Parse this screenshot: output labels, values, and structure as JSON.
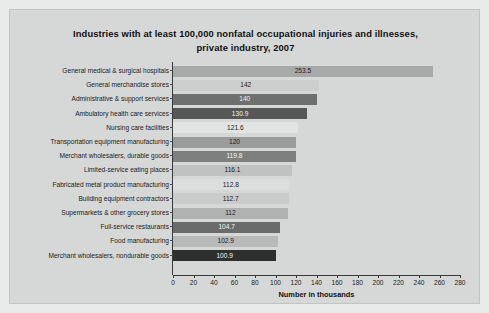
{
  "chart_data": {
    "type": "bar",
    "orientation": "horizontal",
    "title": "Industries with at least 100,000 nonfatal occupational injuries and illnesses, private industry, 2007",
    "title_line1": "Industries with at least 100,000 nonfatal occupational injuries and illnesses,",
    "title_line2": "private industry, 2007",
    "xlabel": "Number in thousands",
    "ylabel": "",
    "xlim": [
      0,
      280
    ],
    "xticks": [
      0,
      20,
      40,
      60,
      80,
      100,
      120,
      140,
      160,
      180,
      200,
      220,
      240,
      260,
      280
    ],
    "grid": false,
    "legend": "none",
    "categories": [
      "General medical & surgical hospitals",
      "General merchandise stores",
      "Administrative & support services",
      "Ambulatory health care services",
      "Nursing care facilities",
      "Transportation equipment manufacturing",
      "Merchant wholesalers, durable goods",
      "Limited-service eating places",
      "Fabricated metal product manufacturing",
      "Building equipment contractors",
      "Supermarkets & other grocery stores",
      "Full-service restaurants",
      "Food manufacturing",
      "Merchant wholesalers, nondurable goods"
    ],
    "values": [
      253.5,
      142,
      140,
      130.9,
      121.6,
      120,
      119.8,
      116.1,
      112.8,
      112.7,
      112,
      104.7,
      102.9,
      100.9
    ],
    "value_labels": [
      "253.5",
      "142",
      "140",
      "130.9",
      "121.6",
      "120",
      "119.8",
      "116.1",
      "112.8",
      "112.7",
      "112",
      "104.7",
      "102.9",
      "100.9"
    ],
    "bar_colors": [
      "#a8aaaa",
      "#cdcfcf",
      "#6e7070",
      "#565858",
      "#e2e4e4",
      "#9a9c9c",
      "#7e8080",
      "#c0c2c2",
      "#dcdede",
      "#cacccc",
      "#b0b2b2",
      "#6a6c6c",
      "#b8baba",
      "#2e3030"
    ],
    "label_on_dark": [
      false,
      false,
      true,
      true,
      false,
      false,
      true,
      false,
      false,
      false,
      false,
      true,
      false,
      true
    ]
  },
  "page": {
    "background": "#e9eaea",
    "plot_background": "#d6d8d8",
    "axis_color": "#3a3a3a",
    "text_color": "#1a1a1a"
  }
}
